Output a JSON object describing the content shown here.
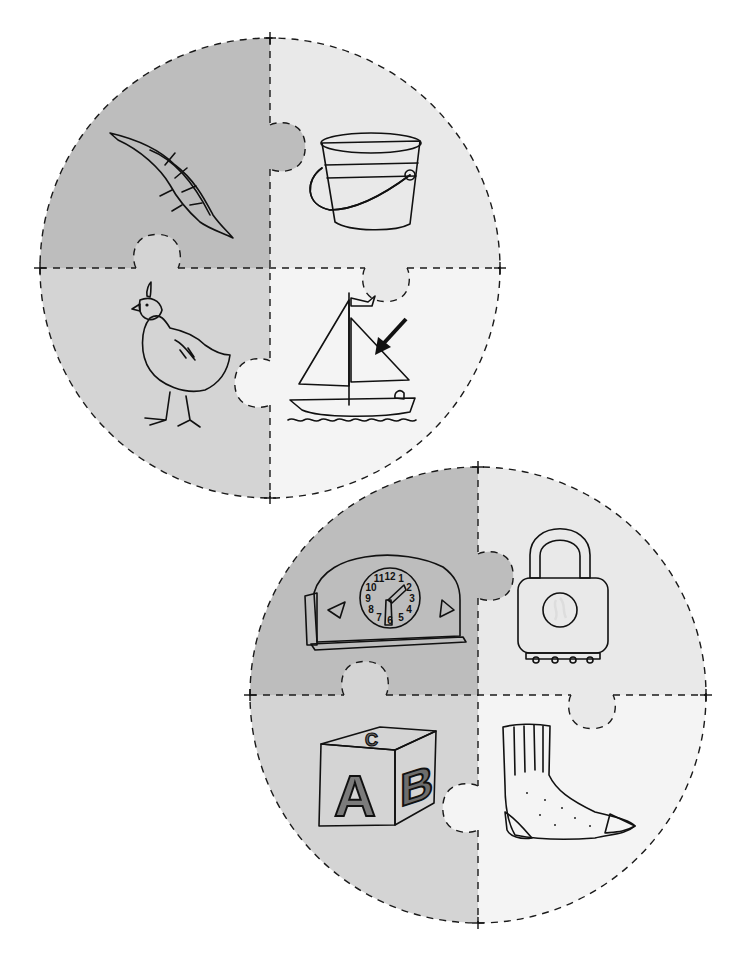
{
  "page": {
    "width": 742,
    "height": 970,
    "background": "#ffffff"
  },
  "colors": {
    "quadrant_dark": "#bdbdbd",
    "quadrant_mid": "#d2d2d2",
    "quadrant_light": "#e6e6e6",
    "quadrant_white": "#f3f3f3",
    "cut_line": "#1a1a1a",
    "ink": "#111111"
  },
  "puzzles": [
    {
      "id": "puzzle-1",
      "center": [
        270,
        268
      ],
      "radius": 230,
      "tabs": [
        {
          "between": "top-left->top-right",
          "axis": "vertical",
          "at": 147,
          "size": 22,
          "dir": 1
        },
        {
          "between": "bottom-left->top-left",
          "axis": "horizontal",
          "at": 157,
          "size": 21,
          "dir": -1
        },
        {
          "between": "top-right->bottom-right",
          "axis": "horizontal",
          "at": 386,
          "size": 21,
          "dir": 1
        },
        {
          "between": "bottom-right->bottom-left",
          "axis": "vertical",
          "at": 383,
          "size": 22,
          "dir": -1
        }
      ],
      "pieces": [
        {
          "position": "top-left",
          "fill": "#bdbdbd",
          "picture": "feather",
          "label": "feather"
        },
        {
          "position": "top-right",
          "fill": "#e9e9e9",
          "picture": "pail",
          "label": "pail"
        },
        {
          "position": "bottom-left",
          "fill": "#d4d4d4",
          "picture": "quail",
          "label": "quail"
        },
        {
          "position": "bottom-right",
          "fill": "#f4f4f4",
          "picture": "sailboat",
          "label": "sail"
        }
      ],
      "annotation": {
        "type": "arrow",
        "points_to": "sail"
      }
    },
    {
      "id": "puzzle-2",
      "center": [
        478,
        695
      ],
      "radius": 228,
      "tabs": [
        {
          "between": "top-left->top-right",
          "axis": "vertical",
          "at": 576,
          "size": 22,
          "dir": 1
        },
        {
          "between": "bottom-left->top-left",
          "axis": "horizontal",
          "at": 365,
          "size": 21,
          "dir": -1
        },
        {
          "between": "top-right->bottom-right",
          "axis": "horizontal",
          "at": 592,
          "size": 21,
          "dir": 1
        },
        {
          "between": "bottom-right->bottom-left",
          "axis": "vertical",
          "at": 808,
          "size": 22,
          "dir": -1
        }
      ],
      "pieces": [
        {
          "position": "top-left",
          "fill": "#bdbdbd",
          "picture": "clock",
          "label": "clock"
        },
        {
          "position": "top-right",
          "fill": "#e9e9e9",
          "picture": "padlock",
          "label": "lock"
        },
        {
          "position": "bottom-left",
          "fill": "#d4d4d4",
          "picture": "block",
          "label": "block"
        },
        {
          "position": "bottom-right",
          "fill": "#f4f4f4",
          "picture": "sock",
          "label": "sock"
        }
      ]
    }
  ],
  "pictures": {
    "clock": {
      "numerals": [
        "12",
        "1",
        "2",
        "3",
        "4",
        "5",
        "6",
        "7",
        "8",
        "9",
        "10",
        "11"
      ]
    },
    "block": {
      "letters": [
        "A",
        "B",
        "C"
      ]
    }
  }
}
